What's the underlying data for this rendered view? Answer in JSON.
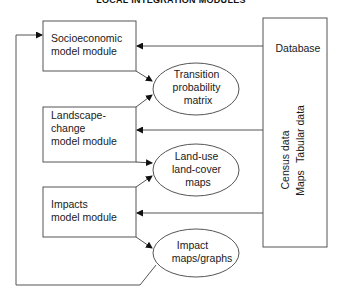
{
  "title": "LOCAL INTEGRATION MODULES",
  "modules": [
    {
      "id": "socioeconomic",
      "lines": [
        "Socioeconomic",
        "model module"
      ]
    },
    {
      "id": "landscape",
      "lines": [
        "Landscape-",
        "change",
        "model module"
      ]
    },
    {
      "id": "impacts",
      "lines": [
        "Impacts",
        "model module"
      ]
    }
  ],
  "outputs": [
    {
      "id": "transition",
      "lines": [
        "Transition",
        "probability",
        "matrix"
      ]
    },
    {
      "id": "landuse",
      "lines": [
        "Land-use",
        "land-cover",
        "maps"
      ]
    },
    {
      "id": "impact",
      "lines": [
        "Impact",
        "maps/graphs"
      ]
    }
  ],
  "database": {
    "label": "Database",
    "items": [
      "Tabular data",
      "Census data",
      "Maps"
    ]
  },
  "colors": {
    "stroke": "#555555",
    "text": "#1a1a1a",
    "background": "#ffffff"
  }
}
